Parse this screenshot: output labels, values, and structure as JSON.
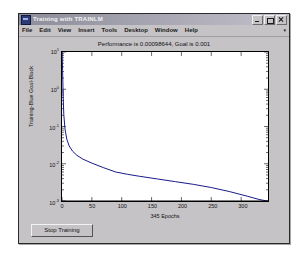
{
  "window": {
    "title": "Training with TRAINLM",
    "icon": "matlab-figure-icon",
    "buttons": {
      "minimize": "minimize-icon",
      "maximize": "maximize-icon",
      "close": "close-icon"
    }
  },
  "menu": {
    "items": [
      "File",
      "Edit",
      "View",
      "Insert",
      "Tools",
      "Desktop",
      "Window",
      "Help"
    ],
    "overflow": "▾"
  },
  "controls": {
    "stop_training": "Stop Training"
  },
  "chart_data": {
    "type": "line",
    "title": "Performance is 0.00098644, Goal is 0.001",
    "xlabel": "345 Epochs",
    "ylabel": "Training-Blue  Goal-Black",
    "xlim": [
      0,
      345
    ],
    "ylim": [
      0.001,
      10
    ],
    "yscale": "log",
    "xscale": "linear",
    "grid": false,
    "xticks": [
      0,
      50,
      100,
      150,
      200,
      250,
      300
    ],
    "xticklabels": [
      "0",
      "50",
      "100",
      "150",
      "200",
      "250",
      "300"
    ],
    "yticks": [
      10,
      1,
      0.1,
      0.01,
      0.001
    ],
    "yticklabels": [
      "10",
      "10",
      "10",
      "10",
      "10"
    ],
    "yticksups": [
      "1",
      "0",
      "-1",
      "-2",
      "-3"
    ],
    "legend_position": "none",
    "series": [
      {
        "name": "Training-Blue",
        "color": "#1a1a8c",
        "x": [
          0,
          1,
          2,
          3,
          5,
          8,
          12,
          18,
          25,
          35,
          50,
          70,
          90,
          110,
          130,
          160,
          190,
          220,
          250,
          280,
          310,
          330,
          345
        ],
        "y": [
          12.0,
          3.2,
          0.62,
          0.21,
          0.085,
          0.046,
          0.03,
          0.0215,
          0.0168,
          0.0133,
          0.0104,
          0.0078,
          0.006,
          0.0052,
          0.0046,
          0.0039,
          0.0033,
          0.0028,
          0.0023,
          0.0018,
          0.00135,
          0.0011,
          0.00098644
        ]
      },
      {
        "name": "Goal-Black",
        "color": "#000000",
        "x": [
          0,
          345
        ],
        "y": [
          0.001,
          0.001
        ]
      }
    ]
  }
}
